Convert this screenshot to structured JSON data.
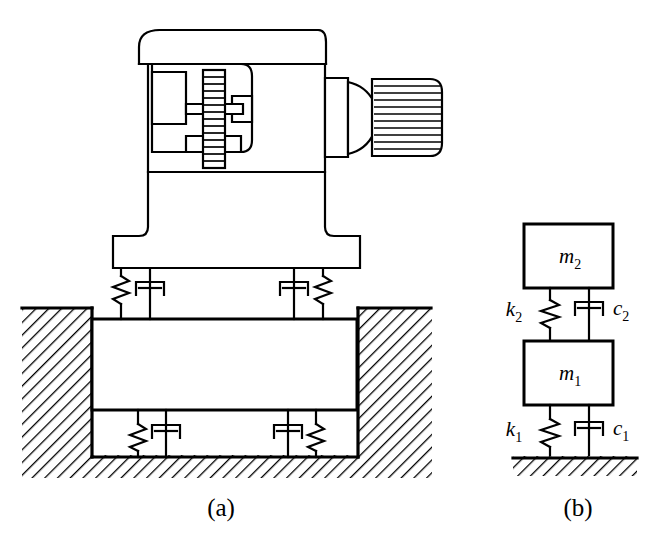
{
  "figure": {
    "background_color": "#ffffff",
    "line_color": "#000000",
    "width": 651,
    "height": 546
  },
  "captions": {
    "a": "(a)",
    "b": "(b)"
  },
  "panel_a": {
    "name": "machine-on-foundation-block",
    "description": "Machine tool with motor mounted on an inertia block resting in a hatched foundation pit, isolated by springs and dampers",
    "components": {
      "machine_head": "machine-c-frame-head",
      "screw_spindle": "threaded-spindle",
      "motor": "electric-motor",
      "machine_base": "machine-base-foot",
      "inertia_block": "concrete-inertia-block",
      "foundation_pit": "hatched-foundation-pit",
      "ground": "hatched-ground"
    },
    "mount_counts": {
      "upper_springs": 2,
      "upper_dampers": 2,
      "lower_springs": 2,
      "lower_dampers": 2
    },
    "motor_fin_count": 11,
    "spindle_thread_count": 14
  },
  "panel_b": {
    "name": "two-dof-lumped-model",
    "description": "Two-degree-of-freedom lumped parameter model: mass m2 on k2/c2 above mass m1 on k1/c1 above ground",
    "masses": [
      {
        "id": "mass-upper",
        "label": "m",
        "subscript": "2"
      },
      {
        "id": "mass-lower",
        "label": "m",
        "subscript": "1"
      }
    ],
    "springs": [
      {
        "id": "spring-upper",
        "label": "k",
        "subscript": "2"
      },
      {
        "id": "spring-lower",
        "label": "k",
        "subscript": "1"
      }
    ],
    "dampers": [
      {
        "id": "damper-upper",
        "label": "c",
        "subscript": "2"
      },
      {
        "id": "damper-lower",
        "label": "c",
        "subscript": "1"
      }
    ],
    "ground_label": "fixed-ground-hatched"
  }
}
